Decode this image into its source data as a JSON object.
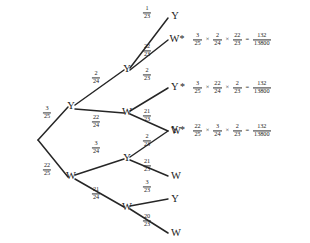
{
  "diagram": {
    "type": "probability-tree",
    "root": {
      "label": ""
    },
    "levels": 3,
    "level1": [
      {
        "id": "n-y",
        "label": "Y",
        "prob": {
          "num": "3",
          "den": "25"
        }
      },
      {
        "id": "n-w",
        "label": "W",
        "prob": {
          "num": "22",
          "den": "25"
        }
      }
    ],
    "level2": [
      {
        "id": "n-yy",
        "label": "Y",
        "parent": "n-y",
        "prob": {
          "num": "2",
          "den": "24"
        }
      },
      {
        "id": "n-yw",
        "label": "W",
        "parent": "n-y",
        "prob": {
          "num": "22",
          "den": "24"
        }
      },
      {
        "id": "n-wy",
        "label": "Y",
        "parent": "n-w",
        "prob": {
          "num": "3",
          "den": "24"
        }
      },
      {
        "id": "n-ww",
        "label": "W",
        "parent": "n-w",
        "prob": {
          "num": "21",
          "den": "24"
        }
      }
    ],
    "leaves": [
      {
        "id": "leaf-1",
        "label": "Y",
        "starred": false,
        "parent": "n-yy",
        "prob": {
          "num": "1",
          "den": "23"
        }
      },
      {
        "id": "leaf-2",
        "label": "W",
        "starred": true,
        "parent": "n-yy",
        "prob": {
          "num": "22",
          "den": "23"
        }
      },
      {
        "id": "leaf-3",
        "label": "Y",
        "starred": true,
        "parent": "n-yw",
        "prob": {
          "num": "2",
          "den": "23"
        }
      },
      {
        "id": "leaf-4",
        "label": "W",
        "starred": false,
        "parent": "n-yw",
        "prob": {
          "num": "21",
          "den": "23"
        }
      },
      {
        "id": "leaf-5",
        "label": "Y",
        "starred": true,
        "parent": "n-wy",
        "prob": {
          "num": "2",
          "den": "23"
        }
      },
      {
        "id": "leaf-6",
        "label": "W",
        "starred": false,
        "parent": "n-wy",
        "prob": {
          "num": "21",
          "den": "23"
        }
      },
      {
        "id": "leaf-7",
        "label": "Y",
        "starred": false,
        "parent": "n-ww",
        "prob": {
          "num": "3",
          "den": "23"
        }
      },
      {
        "id": "leaf-8",
        "label": "W",
        "starred": false,
        "parent": "n-ww",
        "prob": {
          "num": "20",
          "den": "23"
        }
      }
    ],
    "star_symbol": "*",
    "equations": [
      {
        "id": "eq-1",
        "for_leaf": "leaf-2",
        "factors": [
          {
            "num": "3",
            "den": "25"
          },
          {
            "num": "2",
            "den": "24"
          },
          {
            "num": "22",
            "den": "23"
          }
        ],
        "times_symbol": "×",
        "equals_symbol": "=",
        "result": {
          "num": "132",
          "den": "13800"
        }
      },
      {
        "id": "eq-2",
        "for_leaf": "leaf-3",
        "factors": [
          {
            "num": "3",
            "den": "25"
          },
          {
            "num": "22",
            "den": "24"
          },
          {
            "num": "2",
            "den": "23"
          }
        ],
        "times_symbol": "×",
        "equals_symbol": "=",
        "result": {
          "num": "132",
          "den": "13800"
        }
      },
      {
        "id": "eq-3",
        "for_leaf": "leaf-5",
        "factors": [
          {
            "num": "22",
            "den": "25"
          },
          {
            "num": "3",
            "den": "24"
          },
          {
            "num": "2",
            "den": "23"
          }
        ],
        "times_symbol": "×",
        "equals_symbol": "=",
        "result": {
          "num": "132",
          "den": "13800"
        }
      }
    ],
    "colors": {
      "background": "#ffffff",
      "ink": "#1a1a1a",
      "edge": "#262626"
    }
  }
}
